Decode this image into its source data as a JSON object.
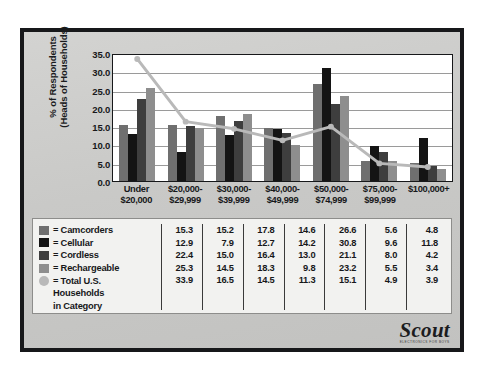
{
  "chart_data": {
    "type": "bar",
    "title": "",
    "xlabel": "",
    "ylabel": "% of Respondents (Heads of Households)",
    "ylabel_line1": "% of Respondents",
    "ylabel_line2": "(Heads of Households)",
    "ylim": [
      0.0,
      35.0
    ],
    "ytick_step": 5.0,
    "yticks": [
      "0.0",
      "5.0",
      "10.0",
      "15.0",
      "20.0",
      "25.0",
      "30.0",
      "35.0"
    ],
    "grid": true,
    "legend_position": "table-below",
    "categories": [
      {
        "line1": "Under",
        "line2": "$20,000"
      },
      {
        "line1": "$20,000-",
        "line2": "$29,999"
      },
      {
        "line1": "$30,000-",
        "line2": "$39,999"
      },
      {
        "line1": "$40,000-",
        "line2": "$49,999"
      },
      {
        "line1": "$50,000-",
        "line2": "$74,999"
      },
      {
        "line1": "$75,000-",
        "line2": "$99,999"
      },
      {
        "line1": "$100,000+",
        "line2": ""
      }
    ],
    "series": [
      {
        "name": "Camcorders",
        "kind": "bar",
        "color": "#6f6f6f",
        "values": [
          15.3,
          15.2,
          17.8,
          14.6,
          26.6,
          5.6,
          4.8
        ]
      },
      {
        "name": "Cellular",
        "kind": "bar",
        "color": "#141414",
        "values": [
          12.9,
          7.9,
          12.7,
          14.2,
          30.8,
          9.6,
          11.8
        ]
      },
      {
        "name": "Cordless",
        "kind": "bar",
        "color": "#3e3e3e",
        "values": [
          22.4,
          15.0,
          16.4,
          13.0,
          21.1,
          8.0,
          4.2
        ]
      },
      {
        "name": "Rechargeable",
        "kind": "bar",
        "color": "#8e8e8e",
        "values": [
          25.3,
          14.5,
          18.3,
          9.8,
          23.2,
          5.5,
          3.4
        ]
      },
      {
        "name": "Total U.S. Households in Category",
        "kind": "line",
        "color": "#b9b9b9",
        "values": [
          33.9,
          16.5,
          14.5,
          11.3,
          15.1,
          4.9,
          3.9
        ]
      }
    ]
  },
  "legend": [
    {
      "prefix": "= ",
      "label": "Camcorders",
      "swatch": "swatch-camcorders"
    },
    {
      "prefix": "= ",
      "label": "Cellular",
      "swatch": "swatch-cellular"
    },
    {
      "prefix": "= ",
      "label": "Cordless",
      "swatch": "swatch-cordless"
    },
    {
      "prefix": "= ",
      "label": "Rechargeable",
      "swatch": "swatch-rechargeable"
    },
    {
      "prefix": "= ",
      "label": "Total U.S.",
      "swatch": "swatch-total-us-households",
      "cont1": "Households",
      "cont2": "in Category"
    }
  ],
  "logo": {
    "word": "Scout",
    "subtitle": "ELECTRONICS FOR BOYS"
  }
}
